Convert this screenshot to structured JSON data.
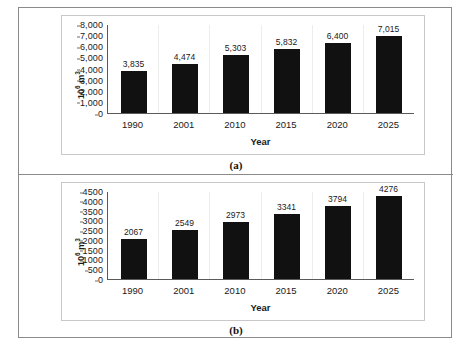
{
  "figure": {
    "panels": [
      {
        "id": "a",
        "caption": "(a)",
        "chart_data": {
          "type": "bar",
          "title": "",
          "subtitle": "",
          "xlabel": "Year",
          "ylabel": "10⁶ m³",
          "ylabel_base": "10",
          "ylabel_exponent": "6",
          "ylabel_unit": "m",
          "ylabel_unit_exponent": "3",
          "categories": [
            "1990",
            "2001",
            "2010",
            "2015",
            "2020",
            "2025"
          ],
          "values": [
            3835,
            4474,
            5303,
            5832,
            6400,
            7015
          ],
          "data_labels": [
            "3,835",
            "4,474",
            "5,303",
            "5,832",
            "6,400",
            "7,015"
          ],
          "ylim": [
            0,
            8000
          ],
          "ytick_values": [
            0,
            1000,
            2000,
            3000,
            4000,
            5000,
            6000,
            7000,
            8000
          ],
          "ytick_labels": [
            "0",
            "1,000",
            "2,000",
            "3,000",
            "4,000",
            "5,000",
            "6,000",
            "7,000",
            "8,000"
          ],
          "grid": "vertical-only",
          "legend": "none",
          "bar_color": "#111111"
        }
      },
      {
        "id": "b",
        "caption": "(b)",
        "chart_data": {
          "type": "bar",
          "title": "",
          "subtitle": "",
          "xlabel": "Year",
          "ylabel": "10⁶ m³",
          "ylabel_base": "10",
          "ylabel_exponent": "6",
          "ylabel_unit": "m",
          "ylabel_unit_exponent": "3",
          "categories": [
            "1990",
            "2001",
            "2010",
            "2015",
            "2020",
            "2025"
          ],
          "values": [
            2067,
            2549,
            2973,
            3341,
            3794,
            4276
          ],
          "data_labels": [
            "2067",
            "2549",
            "2973",
            "3341",
            "3794",
            "4276"
          ],
          "ylim": [
            0,
            4500
          ],
          "ytick_values": [
            0,
            500,
            1000,
            1500,
            2000,
            2500,
            3000,
            3500,
            4000,
            4500
          ],
          "ytick_labels": [
            "0",
            "500",
            "1000",
            "1500",
            "2000",
            "2500",
            "3000",
            "3500",
            "4000",
            "4500"
          ],
          "grid": "vertical-only",
          "legend": "none",
          "bar_color": "#111111"
        }
      }
    ]
  },
  "chart_data": [
    {
      "type": "bar",
      "panel": "(a)",
      "title": "",
      "xlabel": "Year",
      "ylabel": "10^6 m^3",
      "categories": [
        "1990",
        "2001",
        "2010",
        "2015",
        "2020",
        "2025"
      ],
      "values": [
        3835,
        4474,
        5303,
        5832,
        6400,
        7015
      ],
      "ylim": [
        0,
        8000
      ],
      "ytick_labels": [
        "0",
        "1,000",
        "2,000",
        "3,000",
        "4,000",
        "5,000",
        "6,000",
        "7,000",
        "8,000"
      ],
      "grid": "vertical-only",
      "legend": "none"
    },
    {
      "type": "bar",
      "panel": "(b)",
      "title": "",
      "xlabel": "Year",
      "ylabel": "10^6 m^3",
      "categories": [
        "1990",
        "2001",
        "2010",
        "2015",
        "2020",
        "2025"
      ],
      "values": [
        2067,
        2549,
        2973,
        3341,
        3794,
        4276
      ],
      "ylim": [
        0,
        4500
      ],
      "ytick_labels": [
        "0",
        "500",
        "1000",
        "1500",
        "2000",
        "2500",
        "3000",
        "3500",
        "4000",
        "4500"
      ],
      "grid": "vertical-only",
      "legend": "none"
    }
  ]
}
